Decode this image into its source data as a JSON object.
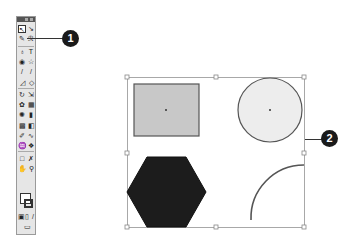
{
  "toolbox": {
    "tools": [
      {
        "name": "selection-tool",
        "glyph": "↖",
        "selected": true
      },
      {
        "name": "direct-selection-tool",
        "glyph": "↘"
      },
      {
        "name": "magic-wand-tool",
        "glyph": "✎"
      },
      {
        "name": "lasso-tool",
        "glyph": "ℛ"
      },
      {
        "name": "pen-tool",
        "glyph": "♁"
      },
      {
        "name": "type-tool",
        "glyph": "T"
      },
      {
        "name": "ellipse-tool",
        "glyph": "◉"
      },
      {
        "name": "star-tool",
        "glyph": "☆"
      },
      {
        "name": "paintbrush-tool",
        "glyph": "/"
      },
      {
        "name": "pencil-tool",
        "glyph": "/"
      },
      {
        "name": "blob-brush-tool",
        "glyph": "◿"
      },
      {
        "name": "eraser-tool",
        "glyph": "◇"
      },
      {
        "name": "rotate-tool",
        "glyph": "↻"
      },
      {
        "name": "scale-tool",
        "glyph": "⇲"
      },
      {
        "name": "warp-tool",
        "glyph": "✿"
      },
      {
        "name": "free-transform-tool",
        "glyph": "▦"
      },
      {
        "name": "symbol-sprayer-tool",
        "glyph": "✺"
      },
      {
        "name": "column-graph-tool",
        "glyph": "▮"
      },
      {
        "name": "mesh-tool",
        "glyph": "▩"
      },
      {
        "name": "gradient-tool",
        "glyph": "◧"
      },
      {
        "name": "eyedropper-tool",
        "glyph": "✐"
      },
      {
        "name": "blend-tool",
        "glyph": "∿"
      },
      {
        "name": "live-paint-bucket-tool",
        "glyph": "♒"
      },
      {
        "name": "live-paint-selection-tool",
        "glyph": "❖"
      },
      {
        "name": "artboard-tool",
        "glyph": "□"
      },
      {
        "name": "slice-tool",
        "glyph": "✗"
      },
      {
        "name": "hand-tool",
        "glyph": "✋"
      },
      {
        "name": "zoom-tool",
        "glyph": "⚲"
      }
    ],
    "bottom": {
      "fill_stroke": "fill-stroke-swatches",
      "modes": [
        "▣",
        "▯",
        "/"
      ],
      "screen_mode": "▭"
    }
  },
  "callouts": [
    {
      "label": "1"
    },
    {
      "label": "2"
    }
  ],
  "artboard": {
    "bounding_box_color": "#9a9a9a",
    "rect_fill": "#c8c8c8",
    "rect_stroke": "#555555",
    "circle_fill": "#ededed",
    "circle_stroke": "#555555",
    "hexagon_fill": "#1c1c1c",
    "arc_stroke": "#555555"
  }
}
